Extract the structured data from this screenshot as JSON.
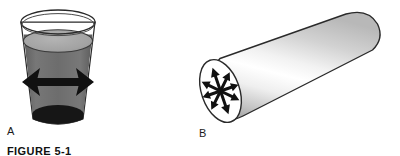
{
  "figure": {
    "caption": "FIGURE 5-1",
    "background_color": "#ffffff",
    "panels": [
      {
        "id": "a",
        "label": "A",
        "subject": "beaker-of-liquid",
        "description": "Glass beaker partly filled with liquid, a black double-headed horizontal arrow drawn inside the liquid",
        "annotation_icon": "double-headed-horizontal-arrow",
        "arrow_count": 2,
        "arrow_color": "#111111",
        "glass_outline_color": "#2a2a2a",
        "liquid_body_color": "#6e6e6e",
        "liquid_surface_color": "#a9a9a9",
        "vessel_floor_color": "#1a1a1a"
      },
      {
        "id": "b",
        "label": "B",
        "subject": "solid-cylinder",
        "description": "Tilted three-dimensional cylinder with a star of radiating arrows drawn on its circular end face",
        "annotation_icon": "radial-arrow-star",
        "arrow_count": 8,
        "arrow_color": "#111111",
        "cylinder_outline_color": "#2a2a2a",
        "cylinder_highlight_color": "#ffffff",
        "cylinder_shade_color": "#b4b4b4"
      }
    ]
  }
}
